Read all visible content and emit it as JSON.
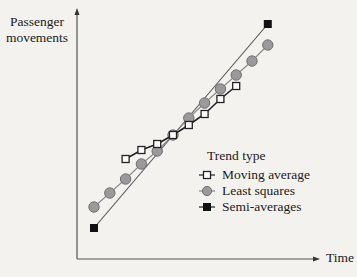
{
  "chart_data": {
    "type": "line",
    "title": "",
    "xlabel": "Time",
    "ylabel": "Passenger movements",
    "x": [
      1,
      2,
      3,
      4,
      5,
      6,
      7,
      8,
      9,
      10,
      11,
      12
    ],
    "grid": false,
    "axis_ticks": false,
    "legend": {
      "title": "Trend type",
      "position": "lower right (inside plot)"
    },
    "series": [
      {
        "name": "Moving average",
        "marker": "open-square",
        "color": "#1a1a1a",
        "x": [
          3,
          4,
          5,
          6,
          7,
          8,
          9,
          10
        ],
        "values": [
          100,
          109,
          115,
          124,
          134,
          145,
          160,
          173
        ]
      },
      {
        "name": "Least squares",
        "marker": "grey-circle",
        "color": "#8c8c8c",
        "x": [
          1,
          2,
          3,
          4,
          5,
          6,
          7,
          8,
          9,
          10,
          11,
          12
        ],
        "values": [
          52,
          66,
          80,
          95,
          108,
          124,
          141,
          156,
          170,
          184,
          198,
          214
        ]
      },
      {
        "name": "Semi-averages",
        "marker": "filled-square",
        "color": "#111111",
        "x": [
          1,
          12
        ],
        "values": [
          31,
          235
        ]
      }
    ],
    "xlim": [
      0,
      14.3
    ],
    "ylim": [
      0,
      250
    ]
  },
  "axes": {
    "y_label_line1": "Passenger",
    "y_label_line2": "movements",
    "x_label": "Time"
  },
  "legend": {
    "title": "Trend type",
    "items": [
      {
        "label": "Moving average",
        "icon": "open-square-marker"
      },
      {
        "label": "Least squares",
        "icon": "grey-circle-marker"
      },
      {
        "label": "Semi-averages",
        "icon": "filled-square-marker"
      }
    ]
  }
}
